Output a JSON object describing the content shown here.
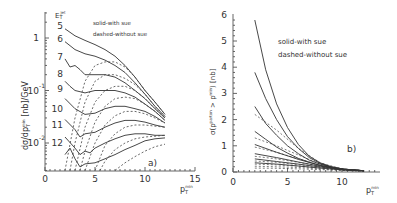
{
  "chart_data": [
    {
      "type": "line",
      "panel_label": "a)",
      "title": "",
      "xlabel": "p_T^min",
      "ylabel": "dσ/dp_T^min [nb]/GeV",
      "xlim": [
        0,
        15
      ],
      "ylim_log": [
        0.003,
        3
      ],
      "yscale": "log",
      "x_ticks": [
        "0",
        "5",
        "10",
        "15"
      ],
      "y_ticks": [
        "1",
        "10^-1",
        "10^-2"
      ],
      "legend": [
        "solid-with sue",
        "dashed-without sue"
      ],
      "curve_label_header": "E_T^jet",
      "curve_labels": [
        "5",
        "6",
        "7",
        "8",
        "9",
        "10",
        "11",
        "12"
      ],
      "series_solid": [
        {
          "name": "E_T^jet=5",
          "x": [
            2,
            3,
            4,
            5,
            6,
            7,
            8,
            9,
            10,
            11,
            12
          ],
          "y": [
            1.5,
            1.1,
            0.9,
            0.75,
            0.6,
            0.45,
            0.3,
            0.18,
            0.1,
            0.06,
            0.035
          ]
        },
        {
          "name": "E_T^jet=6",
          "x": [
            2,
            3,
            4,
            5,
            6,
            7,
            8,
            9,
            10,
            11,
            12
          ],
          "y": [
            0.85,
            0.6,
            0.5,
            0.45,
            0.38,
            0.3,
            0.22,
            0.14,
            0.085,
            0.05,
            0.032
          ]
        },
        {
          "name": "E_T^jet=7",
          "x": [
            2,
            2.5,
            3,
            3.5,
            4,
            5,
            6,
            7,
            8,
            9,
            10,
            11,
            12
          ],
          "y": [
            0.4,
            0.28,
            0.3,
            0.25,
            0.2,
            0.2,
            0.2,
            0.18,
            0.14,
            0.1,
            0.07,
            0.045,
            0.03
          ]
        },
        {
          "name": "E_T^jet=8",
          "x": [
            2,
            2.5,
            3,
            4,
            5,
            6,
            7,
            8,
            9,
            10,
            11,
            12
          ],
          "y": [
            0.15,
            0.12,
            0.1,
            0.09,
            0.1,
            0.1,
            0.1,
            0.09,
            0.075,
            0.055,
            0.04,
            0.027
          ]
        },
        {
          "name": "E_T^jet=9",
          "x": [
            2,
            3,
            4,
            5,
            6,
            7,
            8,
            9,
            10,
            11,
            12
          ],
          "y": [
            0.07,
            0.045,
            0.035,
            0.037,
            0.045,
            0.05,
            0.05,
            0.045,
            0.04,
            0.032,
            0.024
          ]
        },
        {
          "name": "E_T^jet=10",
          "x": [
            2,
            3,
            3.5,
            4,
            5,
            6,
            7,
            8,
            9,
            10,
            11,
            12
          ],
          "y": [
            0.028,
            0.018,
            0.013,
            0.015,
            0.016,
            0.02,
            0.024,
            0.027,
            0.027,
            0.025,
            0.022,
            0.02
          ]
        },
        {
          "name": "E_T^jet=11",
          "x": [
            2,
            3,
            3.5,
            4,
            4.5,
            5,
            6,
            7,
            8,
            9,
            10,
            11,
            12
          ],
          "y": [
            0.013,
            0.008,
            0.006,
            0.007,
            0.0065,
            0.008,
            0.01,
            0.012,
            0.014,
            0.015,
            0.015,
            0.014,
            0.014
          ]
        },
        {
          "name": "E_T^jet=12",
          "x": [
            2,
            2.5,
            3,
            3.5,
            4,
            5,
            6,
            7,
            8,
            9,
            10,
            11,
            12
          ],
          "y": [
            0.006,
            0.008,
            0.005,
            0.0035,
            0.004,
            0.0042,
            0.005,
            0.006,
            0.0075,
            0.009,
            0.011,
            0.012,
            0.0125
          ]
        }
      ],
      "series_dashed": [
        {
          "name": "E_T^jet=5",
          "x": [
            2,
            3,
            4,
            5,
            6,
            7,
            8,
            9,
            10,
            11,
            12
          ],
          "y": [
            0.003,
            0.03,
            0.15,
            0.3,
            0.35,
            0.35,
            0.28,
            0.18,
            0.1,
            0.06,
            0.035
          ]
        },
        {
          "name": "E_T^jet=6",
          "x": [
            2.5,
            3,
            4,
            5,
            6,
            7,
            8,
            9,
            10,
            11,
            12
          ],
          "y": [
            0.003,
            0.01,
            0.06,
            0.15,
            0.2,
            0.2,
            0.17,
            0.13,
            0.085,
            0.05,
            0.032
          ]
        },
        {
          "name": "E_T^jet=7",
          "x": [
            3,
            4,
            5,
            6,
            7,
            8,
            9,
            10,
            11,
            12
          ],
          "y": [
            0.003,
            0.02,
            0.06,
            0.1,
            0.12,
            0.12,
            0.1,
            0.07,
            0.045,
            0.03
          ]
        },
        {
          "name": "E_T^jet=8",
          "x": [
            3.5,
            4,
            5,
            6,
            7,
            8,
            9,
            10,
            11,
            12
          ],
          "y": [
            0.003,
            0.007,
            0.025,
            0.05,
            0.07,
            0.075,
            0.07,
            0.055,
            0.04,
            0.027
          ]
        },
        {
          "name": "E_T^jet=9",
          "x": [
            4,
            5,
            6,
            7,
            8,
            9,
            10,
            11,
            12
          ],
          "y": [
            0.003,
            0.01,
            0.022,
            0.033,
            0.04,
            0.04,
            0.036,
            0.03,
            0.024
          ]
        },
        {
          "name": "E_T^jet=10",
          "x": [
            5,
            6,
            7,
            8,
            9,
            10,
            11,
            12
          ],
          "y": [
            0.003,
            0.009,
            0.015,
            0.02,
            0.022,
            0.022,
            0.021,
            0.02
          ]
        },
        {
          "name": "E_T^jet=11",
          "x": [
            5.5,
            6,
            7,
            8,
            9,
            10,
            11,
            12
          ],
          "y": [
            0.003,
            0.0045,
            0.0075,
            0.01,
            0.012,
            0.013,
            0.0135,
            0.014
          ]
        },
        {
          "name": "E_T^jet=12",
          "x": [
            7,
            8,
            9,
            10,
            11,
            12
          ],
          "y": [
            0.003,
            0.0042,
            0.0055,
            0.007,
            0.0085,
            0.0095
          ]
        }
      ]
    },
    {
      "type": "line",
      "panel_label": "b)",
      "title": "",
      "xlabel": "p_T^min",
      "ylabel": "σ(p_T^parton > p_T^min) [nb]",
      "xlim": [
        0,
        12.5
      ],
      "ylim": [
        0,
        6
      ],
      "x_ticks": [
        "0",
        "5",
        "10"
      ],
      "y_ticks": [
        "0",
        "1",
        "2",
        "3",
        "4",
        "5",
        "6"
      ],
      "legend": [
        "solid-with sue",
        "dashed-without sue"
      ],
      "series_solid": [
        {
          "name": "E_T^jet=5",
          "x": [
            2,
            3,
            4,
            5,
            6,
            7,
            8,
            9,
            10,
            11,
            12
          ],
          "y": [
            5.8,
            3.9,
            2.6,
            1.7,
            1.05,
            0.6,
            0.35,
            0.2,
            0.12,
            0.08,
            0.05
          ]
        },
        {
          "name": "E_T^jet=6",
          "x": [
            2,
            3,
            4,
            5,
            6,
            7,
            8,
            9,
            10,
            11,
            12
          ],
          "y": [
            3.8,
            2.8,
            2.0,
            1.35,
            0.9,
            0.55,
            0.33,
            0.2,
            0.12,
            0.08,
            0.05
          ]
        },
        {
          "name": "E_T^jet=7",
          "x": [
            2,
            3,
            4,
            5,
            6,
            7,
            8,
            9,
            10,
            11,
            12
          ],
          "y": [
            2.5,
            1.85,
            1.4,
            1.0,
            0.7,
            0.45,
            0.3,
            0.18,
            0.11,
            0.07,
            0.05
          ]
        },
        {
          "name": "E_T^jet=8",
          "x": [
            2,
            3,
            4,
            5,
            6,
            7,
            8,
            9,
            10,
            11,
            12
          ],
          "y": [
            1.55,
            1.25,
            0.95,
            0.72,
            0.52,
            0.37,
            0.25,
            0.16,
            0.1,
            0.07,
            0.05
          ]
        },
        {
          "name": "E_T^jet=9",
          "x": [
            2,
            4,
            6,
            8,
            10,
            12
          ],
          "y": [
            1.05,
            0.75,
            0.48,
            0.25,
            0.1,
            0.05
          ]
        },
        {
          "name": "E_T^jet=10",
          "x": [
            2,
            4,
            6,
            8,
            10,
            12
          ],
          "y": [
            0.7,
            0.55,
            0.38,
            0.22,
            0.1,
            0.05
          ]
        },
        {
          "name": "E_T^jet=11",
          "x": [
            2,
            4,
            6,
            8,
            10,
            12
          ],
          "y": [
            0.5,
            0.4,
            0.3,
            0.19,
            0.09,
            0.05
          ]
        },
        {
          "name": "E_T^jet=12",
          "x": [
            2,
            4,
            6,
            8,
            10,
            12
          ],
          "y": [
            0.35,
            0.3,
            0.23,
            0.15,
            0.08,
            0.04
          ]
        }
      ],
      "series_dashed": [
        {
          "name": "E_T^jet=5",
          "x": [
            2,
            4,
            6,
            8,
            10,
            12
          ],
          "y": [
            2.2,
            1.6,
            0.9,
            0.35,
            0.12,
            0.05
          ]
        },
        {
          "name": "E_T^jet=6",
          "x": [
            2,
            4,
            6,
            8,
            10,
            12
          ],
          "y": [
            1.3,
            1.0,
            0.65,
            0.3,
            0.12,
            0.05
          ]
        },
        {
          "name": "E_T^jet=7",
          "x": [
            2,
            4,
            6,
            8,
            10,
            12
          ],
          "y": [
            0.95,
            0.75,
            0.5,
            0.27,
            0.11,
            0.05
          ]
        },
        {
          "name": "E_T^jet=8",
          "x": [
            2,
            4,
            6,
            8,
            10,
            12
          ],
          "y": [
            0.6,
            0.5,
            0.37,
            0.22,
            0.1,
            0.05
          ]
        },
        {
          "name": "E_T^jet=9",
          "x": [
            2,
            4,
            6,
            8,
            10,
            12
          ],
          "y": [
            0.42,
            0.37,
            0.28,
            0.18,
            0.09,
            0.05
          ]
        },
        {
          "name": "E_T^jet=10",
          "x": [
            2,
            4,
            6,
            8,
            10,
            12
          ],
          "y": [
            0.3,
            0.27,
            0.22,
            0.15,
            0.08,
            0.04
          ]
        },
        {
          "name": "E_T^jet=11",
          "x": [
            2,
            4,
            6,
            8,
            10,
            12
          ],
          "y": [
            0.22,
            0.2,
            0.17,
            0.12,
            0.07,
            0.04
          ]
        },
        {
          "name": "E_T^jet=12",
          "x": [
            2,
            4,
            6,
            8,
            10,
            12
          ],
          "y": [
            0.15,
            0.14,
            0.12,
            0.09,
            0.06,
            0.03
          ]
        }
      ]
    }
  ],
  "text": {
    "a_legend_solid": "solid-with sue",
    "a_legend_dashed": "dashed-without sue",
    "a_panel": "a)",
    "a_header": "E",
    "a_header_sub": "T",
    "a_header_sup": "jet",
    "a_ylabel": "dσ/dp",
    "a_ylabel_sub": "T",
    "a_ylabel_sup": "min",
    "a_ylabel_tail": " [nb]/GeV",
    "a_xlabel": "p",
    "a_xlabel_sub": "T",
    "a_xlabel_sup": "min",
    "b_legend_solid": "solid-with sue",
    "b_legend_dashed": "dashed-without sue",
    "b_panel": "b)",
    "b_ylabel": "σ(p",
    "b_ylabel_sup1": "parton",
    "b_ylabel_mid": " > p",
    "b_ylabel_sup2": "min",
    "b_ylabel_tail": ") [nb]",
    "b_xlabel": "p",
    "b_xlabel_sub": "T",
    "b_xlabel_sup": "min"
  }
}
